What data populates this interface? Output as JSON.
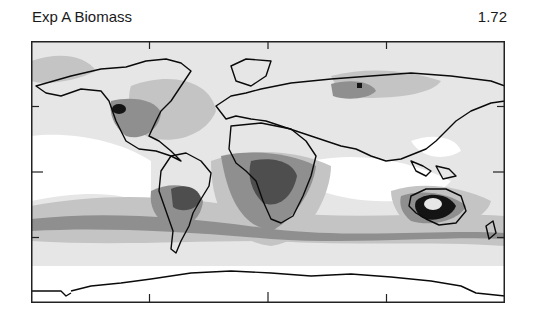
{
  "header": {
    "title": "Exp A Biomass",
    "value": "1.72"
  },
  "map": {
    "projection": "equirectangular-global",
    "frame": {
      "stroke": "#222222"
    },
    "ticks": {
      "x_positions_frac": [
        0.25,
        0.5,
        0.75
      ],
      "y_positions_frac": [
        0.25,
        0.5,
        0.75
      ]
    },
    "shading_levels": [
      {
        "level": 0,
        "color": "#ffffff"
      },
      {
        "level": 1,
        "color": "#e6e6e6"
      },
      {
        "level": 2,
        "color": "#c4c4c4"
      },
      {
        "level": 3,
        "color": "#8f8f8f"
      },
      {
        "level": 4,
        "color": "#4e4e4e"
      },
      {
        "level": 5,
        "color": "#141414"
      }
    ],
    "coastline_color": "#0a0a0a"
  }
}
